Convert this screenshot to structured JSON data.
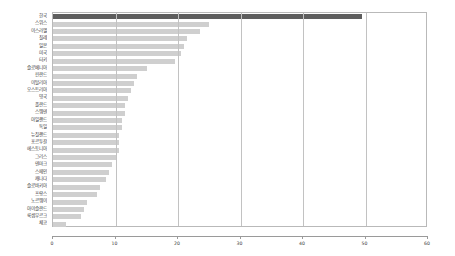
{
  "chart_data": {
    "type": "bar",
    "orientation": "horizontal",
    "title": "",
    "subtitle": "",
    "xlabel": "",
    "ylabel": "",
    "xlim": [
      0,
      60
    ],
    "ylim": null,
    "grid": true,
    "legend": null,
    "xticks": [
      0,
      10,
      20,
      30,
      40,
      50,
      60
    ],
    "xtick_labels": [
      "0",
      "10",
      "20",
      "30",
      "40",
      "50",
      "60"
    ],
    "highlight_category": "한국",
    "colors": {
      "bar": "#cfcfcf",
      "bar_highlight": "#5e5e5e",
      "grid": "#c2c2c2",
      "frame": "#b9b9b9",
      "axis": "#9a9a9a",
      "text": "#3a3a3a",
      "background": "#ffffff"
    },
    "categories": [
      "한국",
      "스위스",
      "이스라엘",
      "칠레",
      "일본",
      "미국",
      "터키",
      "슬로베니아",
      "핀란드",
      "이탈리아",
      "오스트리아",
      "영국",
      "폴란드",
      "스웨덴",
      "아일랜드",
      "독일",
      "뉴질랜드",
      "포르투갈",
      "에스토니아",
      "그리스",
      "덴마크",
      "스페인",
      "캐나다",
      "슬로바키아",
      "프랑스",
      "노르웨이",
      "아이슬란드",
      "룩셈부르크",
      "체코"
    ],
    "values": [
      49.5,
      25.0,
      23.5,
      21.5,
      21.0,
      20.5,
      19.5,
      15.0,
      13.5,
      13.0,
      12.5,
      12.0,
      11.5,
      11.5,
      11.0,
      11.0,
      10.5,
      10.5,
      10.5,
      10.0,
      9.5,
      9.0,
      8.5,
      7.5,
      7.0,
      5.5,
      5.0,
      4.5,
      2.0
    ]
  }
}
